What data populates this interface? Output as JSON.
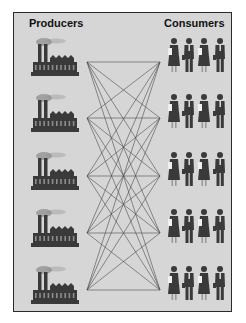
{
  "diagram": {
    "left_heading": "Producers",
    "right_heading": "Consumers",
    "producer_count": 5,
    "consumer_group_count": 5,
    "consumer_people_per_group": 4,
    "connections": "every producer connected to every consumer group (5×5 = 25 lines)",
    "colors": {
      "background": "#d6d6d6",
      "frame": "#2a2a2a",
      "figures": "#3a3a3a",
      "smoke": "#8a8a8a",
      "lines": "#4a4a4a"
    }
  }
}
